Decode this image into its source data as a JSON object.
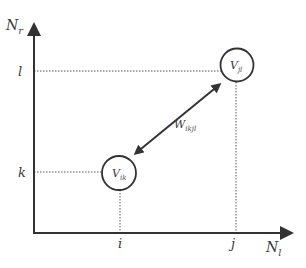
{
  "diagram": {
    "axes": {
      "y_label": "N",
      "y_label_sub": "r",
      "x_label": "N",
      "x_label_sub": "l"
    },
    "ticks": {
      "y": [
        {
          "label": "l"
        },
        {
          "label": "k"
        }
      ],
      "x": [
        {
          "label": "i"
        },
        {
          "label": "j"
        }
      ]
    },
    "nodes": [
      {
        "id": "vik",
        "label": "V",
        "sub": "ik"
      },
      {
        "id": "vjl",
        "label": "V",
        "sub": "jl"
      }
    ],
    "edge": {
      "label": "W",
      "sub": "ikjl",
      "type": "bidirectional"
    },
    "colors": {
      "stroke": "#333333",
      "dotted": "#555555",
      "background": "#ffffff"
    }
  }
}
